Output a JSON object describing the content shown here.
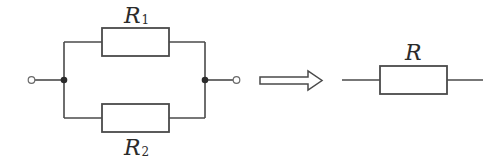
{
  "diagram": {
    "type": "circuit-equivalence",
    "left_circuit": {
      "topology": "parallel",
      "resistors": [
        {
          "id": "R1",
          "symbol": "R",
          "subscript": "1",
          "position": "top branch"
        },
        {
          "id": "R2",
          "symbol": "R",
          "subscript": "2",
          "position": "bottom branch"
        }
      ],
      "terminals": [
        "left",
        "right"
      ],
      "junctions": [
        "left",
        "right"
      ]
    },
    "transform_arrow": "hollow-right-arrow",
    "right_circuit": {
      "topology": "single",
      "resistors": [
        {
          "id": "R",
          "symbol": "R",
          "subscript": ""
        }
      ]
    },
    "colors": {
      "wire": "#4a4a4a",
      "junction": "#2b2b2b",
      "text": "#2b2b2b",
      "background": "#ffffff"
    }
  }
}
